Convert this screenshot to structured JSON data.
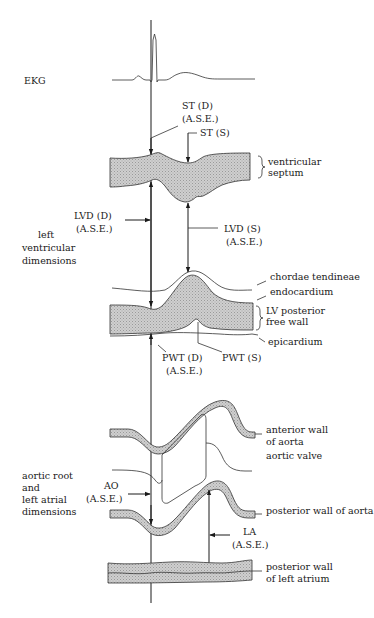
{
  "figure": {
    "type": "M-mode echocardiogram schematic with ASE measurement conventions",
    "header_fragment": "",
    "sections": {
      "ekg": {
        "label": "EKG"
      },
      "left_ventricle": {
        "group_label_lines": [
          "left",
          "ventricular",
          "dimensions"
        ],
        "measurements": {
          "st_d": {
            "line1": "ST (D)",
            "line2": "(A.S.E.)"
          },
          "st_s": {
            "line1": "ST (S)"
          },
          "lvd_d": {
            "line1": "LVD (D)",
            "line2": "(A.S.E.)"
          },
          "lvd_s": {
            "line1": "LVD (S)",
            "line2": "(A.S.E.)"
          },
          "pwt_d": {
            "line1": "PWT (D)",
            "line2": "(A.S.E.)"
          },
          "pwt_s": {
            "line1": "PWT (S)"
          }
        },
        "structures": {
          "ventricular_septum": [
            "ventricular",
            "septum"
          ],
          "chordae_tendineae": "chordae tendineae",
          "endocardium": "endocardium",
          "lv_posterior_free_wall": [
            "LV posterior",
            "free wall"
          ],
          "epicardium": "epicardium"
        }
      },
      "aortic_root": {
        "group_label_lines": [
          "aortic root",
          "and",
          "left atrial",
          "dimensions"
        ],
        "measurements": {
          "ao": {
            "line1": "AO",
            "line2": "(A.S.E.)"
          },
          "la": {
            "line1": "LA",
            "line2": "(A.S.E.)"
          }
        },
        "structures": {
          "anterior_wall_of_aorta": [
            "anterior wall",
            "of aorta"
          ],
          "aortic_valve": "aortic valve",
          "posterior_wall_of_aorta": "posterior wall of aorta",
          "posterior_wall_of_left_atrium": [
            "posterior wall",
            "of left atrium"
          ]
        }
      }
    },
    "colors": {
      "ink": "#1a1a1a",
      "tissue_fill": "#c8c8c8",
      "background": "#ffffff"
    }
  }
}
